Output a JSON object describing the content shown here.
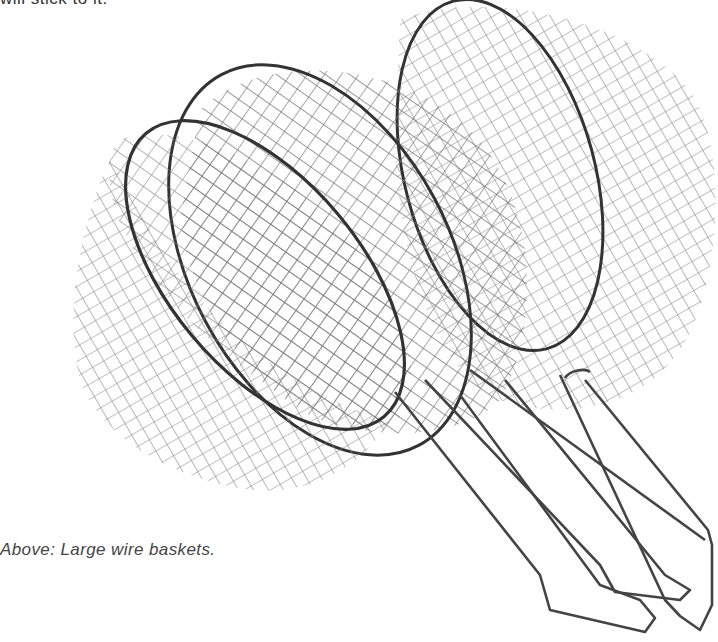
{
  "page": {
    "top_text": "will stick to it.",
    "caption": "Above: Large wire baskets."
  },
  "figure": {
    "icon": "wire-basket-illustration",
    "stroke_color": "#555555",
    "rim_color": "#333333"
  }
}
